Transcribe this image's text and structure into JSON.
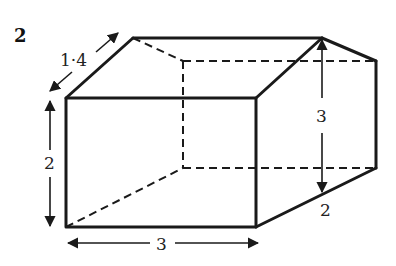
{
  "question_number": "2",
  "shape": "cuboid-prism (box with slanted right face)",
  "labels": {
    "slant_depth": "1·4",
    "left_height": "2",
    "bottom_width": "3",
    "right_height": "3",
    "right_bottom_slant": "2"
  },
  "colors": {
    "line": "#1a1a1a",
    "background": "#ffffff"
  }
}
